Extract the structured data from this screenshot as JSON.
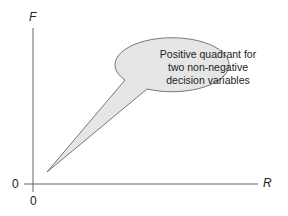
{
  "diagram": {
    "y_axis_label": "F",
    "x_axis_label": "R",
    "y_origin_label": "0",
    "x_origin_label": "0",
    "callout": {
      "lines": [
        "Positive quadrant for",
        "two non-negative",
        "decision variables"
      ],
      "fill_color": "#e6e6e6",
      "stroke_color": "#555555"
    },
    "axis_color": "#666666"
  }
}
